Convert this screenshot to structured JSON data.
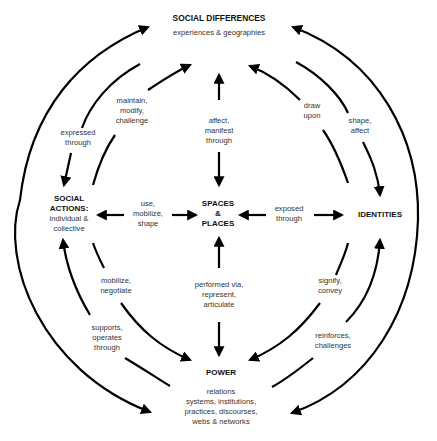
{
  "nodes": {
    "social_differences": {
      "title": "SOCIAL DIFFERENCES",
      "subtitle": "experiences & geographies"
    },
    "social_actions": {
      "title_line1": "SOCIAL",
      "title_line2": "ACTIONS:",
      "subtitle_line1": "individual &",
      "subtitle_line2": "collective"
    },
    "spaces_places": {
      "line1": "SPACES",
      "line2": "&",
      "line3": "PLACES"
    },
    "identities": {
      "title": "IDENTITIES"
    },
    "power": {
      "title": "POWER",
      "sub1": "relations",
      "sub2": "systems, institutions,",
      "sub3": "practices, discourses,",
      "sub4": "webs & networks"
    }
  },
  "edges": {
    "expressed_through": [
      "expressed",
      "through"
    ],
    "maintain_modify_challenge": [
      "maintain,",
      "modify,",
      "challenge"
    ],
    "affect_manifest_through": [
      "affect,",
      "manifest",
      "through"
    ],
    "draw_upon": [
      "draw",
      "upon"
    ],
    "shape_affect": [
      "shape,",
      "affect"
    ],
    "use_mobilize_shape": [
      "use,",
      "mobilize,",
      "shape"
    ],
    "exposed_through": [
      "exposed",
      "through"
    ],
    "mobilize_negotiate": [
      "mobilize,",
      "negotiate"
    ],
    "performed_via": [
      "performed via,",
      "represent,",
      "articulate"
    ],
    "signify_convey": [
      "signify,",
      "convey"
    ],
    "supports_operates_through": [
      "supports,",
      "operates",
      "through"
    ],
    "reinforces_challenges": [
      "reinforces,",
      "challenges"
    ]
  },
  "colors": {
    "stroke": "#000000",
    "text": "#333333",
    "background": "#ffffff"
  }
}
